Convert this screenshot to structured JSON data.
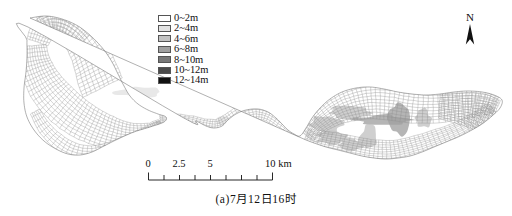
{
  "figure": {
    "caption": "(a)7月12日16时",
    "type": "bathymetry-mesh-map"
  },
  "legend": {
    "title": "",
    "items": [
      {
        "label": "0~2m",
        "color": "#ffffff"
      },
      {
        "label": "2~4m",
        "color": "#e2e2e2"
      },
      {
        "label": "4~6m",
        "color": "#c2c2c2"
      },
      {
        "label": "6~8m",
        "color": "#a0a0a0"
      },
      {
        "label": "8~10m",
        "color": "#787878"
      },
      {
        "label": "10~12m",
        "color": "#4a4a4a"
      },
      {
        "label": "12~14m",
        "color": "#111111"
      }
    ]
  },
  "north_arrow": {
    "label": "N"
  },
  "scale_bar": {
    "unit": "km",
    "labels": [
      {
        "text": "0",
        "value": 0
      },
      {
        "text": "2.5",
        "value": 2.5
      },
      {
        "text": "5",
        "value": 5
      },
      {
        "text": "10 km",
        "value": 10
      }
    ],
    "min": 0,
    "max": 10,
    "tick_count": 9
  },
  "chart_data": {
    "type": "heatmap",
    "title": "(a)7月12日16时",
    "legend_entries": [
      "0~2m",
      "2~4m",
      "4~6m",
      "6~8m",
      "8~10m",
      "10~12m",
      "12~14m"
    ],
    "depth_bins_m": [
      [
        0,
        2
      ],
      [
        2,
        4
      ],
      [
        4,
        6
      ],
      [
        6,
        8
      ],
      [
        8,
        10
      ],
      [
        10,
        12
      ],
      [
        12,
        14
      ]
    ],
    "bin_colors": [
      "#ffffff",
      "#e2e2e2",
      "#c2c2c2",
      "#a0a0a0",
      "#787878",
      "#4a4a4a",
      "#111111"
    ],
    "scale_km": [
      0,
      2.5,
      5,
      10
    ],
    "grid": true,
    "legend_position": "top-center",
    "mesh": {
      "outline_west_lobe": [
        [
          30,
          18
        ],
        [
          46,
          16
        ],
        [
          62,
          19
        ],
        [
          78,
          26
        ],
        [
          92,
          37
        ],
        [
          104,
          50
        ],
        [
          112,
          62
        ],
        [
          118,
          74
        ],
        [
          124,
          86
        ],
        [
          130,
          96
        ],
        [
          138,
          104
        ],
        [
          148,
          110
        ],
        [
          158,
          114
        ],
        [
          166,
          117
        ],
        [
          164,
          122
        ],
        [
          150,
          127
        ],
        [
          134,
          132
        ],
        [
          118,
          139
        ],
        [
          104,
          146
        ],
        [
          92,
          152
        ],
        [
          80,
          155
        ],
        [
          68,
          154
        ],
        [
          56,
          149
        ],
        [
          44,
          141
        ],
        [
          34,
          130
        ],
        [
          27,
          117
        ],
        [
          24,
          103
        ],
        [
          24,
          88
        ],
        [
          26,
          72
        ],
        [
          27,
          56
        ],
        [
          27,
          40
        ],
        [
          28,
          27
        ]
      ],
      "outline_channel": [
        [
          166,
          117
        ],
        [
          182,
          117
        ],
        [
          196,
          121
        ],
        [
          206,
          126
        ],
        [
          214,
          128
        ],
        [
          222,
          126
        ],
        [
          228,
          120
        ],
        [
          236,
          114
        ],
        [
          246,
          110
        ],
        [
          258,
          109
        ],
        [
          268,
          112
        ],
        [
          276,
          118
        ],
        [
          282,
          124
        ],
        [
          288,
          130
        ],
        [
          294,
          134
        ],
        [
          300,
          136
        ]
      ],
      "outline_east_lobe": [
        [
          300,
          136
        ],
        [
          306,
          128
        ],
        [
          312,
          118
        ],
        [
          320,
          108
        ],
        [
          330,
          99
        ],
        [
          342,
          92
        ],
        [
          356,
          88
        ],
        [
          370,
          87
        ],
        [
          384,
          89
        ],
        [
          398,
          92
        ],
        [
          412,
          94
        ],
        [
          426,
          95
        ],
        [
          440,
          94
        ],
        [
          454,
          92
        ],
        [
          468,
          91
        ],
        [
          482,
          92
        ],
        [
          494,
          95
        ],
        [
          502,
          100
        ],
        [
          500,
          108
        ],
        [
          492,
          116
        ],
        [
          482,
          124
        ],
        [
          470,
          131
        ],
        [
          458,
          137
        ],
        [
          446,
          142
        ],
        [
          434,
          147
        ],
        [
          422,
          152
        ],
        [
          410,
          156
        ],
        [
          398,
          158
        ],
        [
          386,
          159
        ],
        [
          374,
          158
        ],
        [
          362,
          156
        ],
        [
          350,
          153
        ],
        [
          338,
          150
        ],
        [
          326,
          147
        ],
        [
          314,
          143
        ],
        [
          306,
          140
        ]
      ],
      "deep_patches": [
        {
          "x": 312,
          "y": 118,
          "w": 28,
          "h": 14,
          "bin": 2
        },
        {
          "x": 330,
          "y": 108,
          "w": 40,
          "h": 10,
          "bin": 2
        },
        {
          "x": 356,
          "y": 116,
          "w": 50,
          "h": 8,
          "bin": 3
        },
        {
          "x": 360,
          "y": 128,
          "w": 16,
          "h": 20,
          "bin": 2
        },
        {
          "x": 318,
          "y": 132,
          "w": 30,
          "h": 12,
          "bin": 2
        },
        {
          "x": 390,
          "y": 104,
          "w": 18,
          "h": 26,
          "bin": 3
        },
        {
          "x": 416,
          "y": 110,
          "w": 14,
          "h": 16,
          "bin": 2
        },
        {
          "x": 340,
          "y": 140,
          "w": 22,
          "h": 10,
          "bin": 2
        },
        {
          "x": 120,
          "y": 88,
          "w": 40,
          "h": 8,
          "bin": 1
        },
        {
          "x": 216,
          "y": 118,
          "w": 20,
          "h": 8,
          "bin": 1
        }
      ]
    }
  }
}
